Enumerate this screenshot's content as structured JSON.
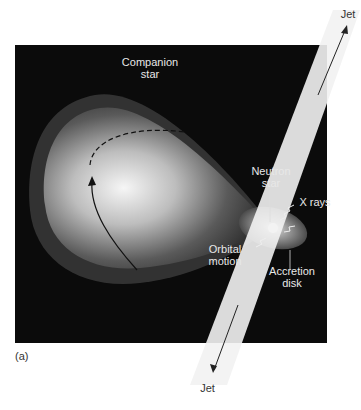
{
  "figure": {
    "panel_label": "(a)",
    "labels": {
      "companion_star": [
        "Companion",
        "star"
      ],
      "neutron_star": [
        "Neutron",
        "star"
      ],
      "x_rays": "X rays",
      "orbital_motion": [
        "Orbital",
        "motion"
      ],
      "accretion_disk": [
        "Accretion",
        "disk"
      ],
      "jet_top": "Jet",
      "jet_bottom": "Jet"
    },
    "colors": {
      "background": "#0b0b0b",
      "star_glow": "#f4f4f4",
      "jet": "#f2f2f2",
      "label_light": "#e8e8e8",
      "label_dark": "#333333"
    }
  }
}
